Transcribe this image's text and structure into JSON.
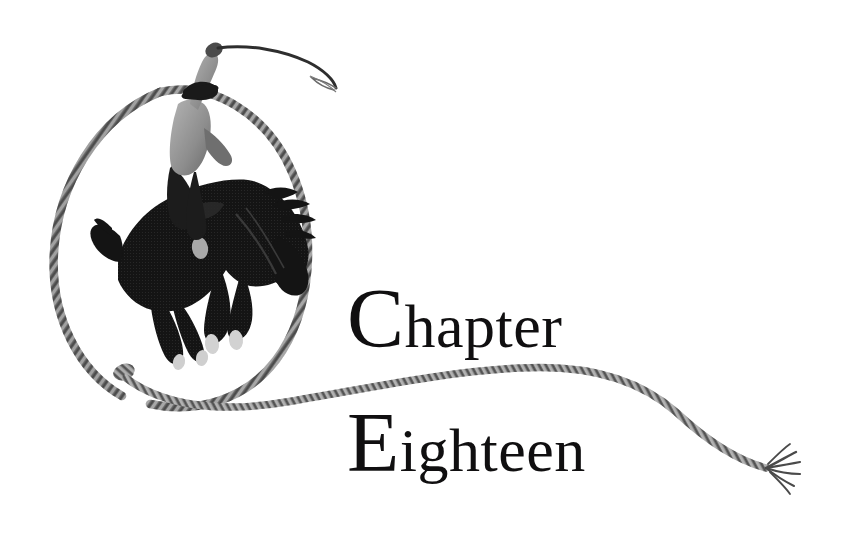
{
  "page": {
    "kind": "book-chapter-opener",
    "background_color": "#ffffff",
    "ink_color": "#100f10"
  },
  "heading": {
    "line_1": "Chapter",
    "line_2": "Eighteen",
    "full_text": "Chapter Eighteen",
    "color": "#100f10"
  },
  "illustration": {
    "caption": "Cowboy riding a bucking bronco inside a lasso loop",
    "style": "halftone engraving",
    "elements": {
      "rider": "cowboy-rider",
      "horse": "bucking-bronco",
      "whip": "raised-whip",
      "loop": "lasso-loop",
      "rope_tail": "rope-tail",
      "rope_end": "frayed-rope-end"
    },
    "colors": {
      "silhouette": "#141414",
      "rope": "#5e5e5e",
      "rope_highlight": "#c9c9c9",
      "shirt": "#9a9a9a",
      "hoof": "#d8d8d8"
    }
  }
}
